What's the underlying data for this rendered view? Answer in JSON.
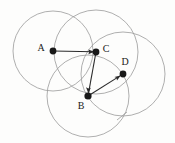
{
  "figure": {
    "background_color": "#fdfdfc",
    "circle_stroke_color": "#9a9a9a",
    "edge_stroke_color": "#2b2b2b",
    "vertex_color": "#181818",
    "width": 175,
    "height": 143
  },
  "points": [
    {
      "id": "A",
      "label": "A",
      "cx": 53,
      "cy": 51,
      "dot_r": 3.4,
      "label_x": 41,
      "label_y": 49,
      "label_anchor": "middle"
    },
    {
      "id": "C",
      "label": "C",
      "cx": 96,
      "cy": 52,
      "dot_r": 3.4,
      "label_x": 106,
      "label_y": 50,
      "label_anchor": "middle"
    },
    {
      "id": "B",
      "label": "B",
      "cx": 88,
      "cy": 96,
      "dot_r": 3.6,
      "label_x": 81,
      "label_y": 107,
      "label_anchor": "middle"
    },
    {
      "id": "D",
      "label": "D",
      "cx": 123,
      "cy": 74,
      "dot_r": 3.4,
      "label_x": 125,
      "label_y": 63,
      "label_anchor": "middle"
    }
  ],
  "circles": [
    {
      "id": "circle-A",
      "center": "A",
      "cx": 53,
      "cy": 51,
      "r": 40
    },
    {
      "id": "circle-C",
      "center": "C",
      "cx": 96,
      "cy": 52,
      "r": 42
    },
    {
      "id": "circle-B",
      "center": "B",
      "cx": 88,
      "cy": 96,
      "r": 41
    },
    {
      "id": "circle-D",
      "center": "D",
      "cx": 123,
      "cy": 74,
      "r": 42
    }
  ],
  "edges": [
    {
      "id": "edge-A-C",
      "from": "A",
      "to": "C",
      "x1": 53,
      "y1": 51,
      "x2": 96,
      "y2": 52,
      "arrow": true
    },
    {
      "id": "edge-C-B",
      "from": "C",
      "to": "B",
      "x1": 96,
      "y1": 52,
      "x2": 88,
      "y2": 96,
      "arrow": true
    },
    {
      "id": "edge-B-D",
      "from": "B",
      "to": "D",
      "x1": 88,
      "y1": 96,
      "x2": 123,
      "y2": 74,
      "arrow": true
    }
  ],
  "marks": [
    {
      "id": "intersection-tick",
      "x": 122,
      "y": 116,
      "kind": "cross-tick"
    }
  ]
}
